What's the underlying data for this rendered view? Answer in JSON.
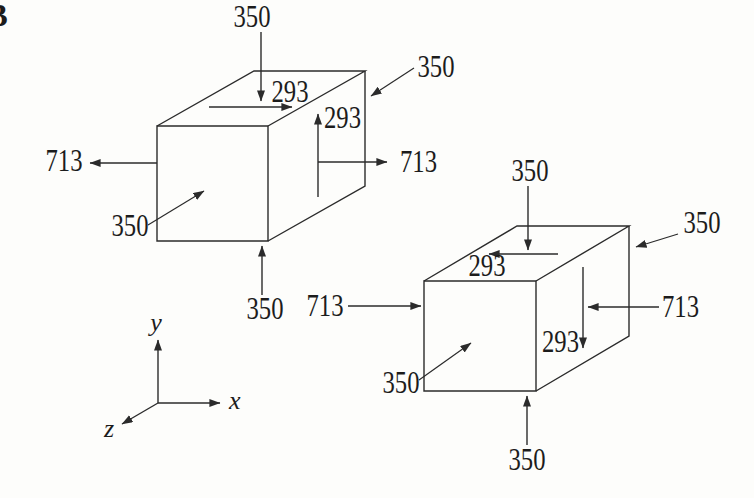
{
  "figure": {
    "corner_mark": "B",
    "axes": {
      "x": "x",
      "y": "y",
      "z": "z"
    },
    "upper_element": {
      "top_normal": "350",
      "top_shear": "293",
      "back_normal": "350",
      "right_shear": "293",
      "right_normal": "713",
      "left_normal": "713",
      "front_normal": "350",
      "bottom_normal": "350"
    },
    "lower_element": {
      "top_normal": "350",
      "top_shear": "293",
      "back_normal": "350",
      "right_shear": "293",
      "right_normal": "713",
      "left_normal": "713",
      "front_normal": "350",
      "bottom_normal": "350"
    }
  }
}
